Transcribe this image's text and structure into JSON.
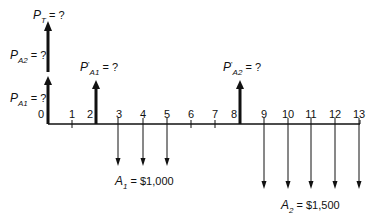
{
  "diagram": {
    "type": "cash-flow-diagram",
    "axis": {
      "periods": [
        "0",
        "1",
        "2",
        "3",
        "4",
        "5",
        "6",
        "7",
        "8",
        "9",
        "10",
        "11",
        "12",
        "13"
      ]
    },
    "labels": {
      "pt": {
        "main": "P",
        "sub": "T",
        "rest": " = ?"
      },
      "pa2": {
        "main": "P",
        "sub": "A2",
        "rest": " = ?"
      },
      "pa1": {
        "main": "P",
        "sub": "A1",
        "rest": " = ?"
      },
      "pa1_prime": {
        "main": "P",
        "sup": "'",
        "sub": "A1",
        "rest": " = ?"
      },
      "pa2_prime": {
        "main": "P",
        "sup": "'",
        "sub": "A2",
        "rest": " = ?"
      },
      "a1": {
        "main": "A",
        "sub": "1",
        "rest": " = $1,000"
      },
      "a2": {
        "main": "A",
        "sub": "2",
        "rest": " = $1,500"
      }
    },
    "upward_arrows": [
      {
        "name": "PT/PA2 arrow",
        "period": 0
      },
      {
        "name": "PA1 arrow",
        "period": 0
      },
      {
        "name": "P'A1 arrow",
        "period": 2
      },
      {
        "name": "P'A2 arrow",
        "period": 8
      }
    ],
    "downward_arrows": {
      "A1": {
        "periods": [
          3,
          4,
          5
        ],
        "amount": "$1,000"
      },
      "A2": {
        "periods": [
          9,
          10,
          11,
          12,
          13
        ],
        "amount": "$1,500"
      }
    }
  }
}
